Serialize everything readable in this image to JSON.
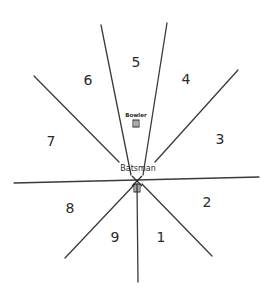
{
  "diagram": {
    "title": "",
    "center": {
      "x": 137,
      "y": 181
    },
    "lines": [
      {
        "name": "upper-left-5-boundary",
        "x1": 101,
        "y1": 25,
        "x2": 131,
        "y2": 175
      },
      {
        "name": "upper-right-5-boundary",
        "x1": 167,
        "y1": 23,
        "x2": 143,
        "y2": 175
      },
      {
        "name": "upper-left-6-7-boundary",
        "x1": 34,
        "y1": 76,
        "x2": 119,
        "y2": 162
      },
      {
        "name": "upper-right-4-3-boundary",
        "x1": 238,
        "y1": 70,
        "x2": 155,
        "y2": 162
      },
      {
        "name": "horizontal-boundary",
        "x1": 14,
        "y1": 183,
        "x2": 259,
        "y2": 177
      },
      {
        "name": "lower-left-8-9-boundary",
        "x1": 65,
        "y1": 258,
        "x2": 135,
        "y2": 184
      },
      {
        "name": "lower-vertical-9-1-boundary",
        "x1": 138,
        "y1": 282,
        "x2": 137,
        "y2": 184
      },
      {
        "name": "lower-right-1-2-boundary",
        "x1": 212,
        "y1": 256,
        "x2": 142,
        "y2": 184
      }
    ],
    "zones": [
      {
        "label": "1",
        "x": 161,
        "y": 242
      },
      {
        "label": "2",
        "x": 207,
        "y": 207
      },
      {
        "label": "3",
        "x": 220,
        "y": 144
      },
      {
        "label": "4",
        "x": 186,
        "y": 84
      },
      {
        "label": "5",
        "x": 136,
        "y": 67
      },
      {
        "label": "6",
        "x": 88,
        "y": 85
      },
      {
        "label": "7",
        "x": 51,
        "y": 146
      },
      {
        "label": "8",
        "x": 70,
        "y": 213
      },
      {
        "label": "9",
        "x": 115,
        "y": 242
      }
    ],
    "bowler": {
      "label": "Bowler",
      "x": 136,
      "y": 117
    },
    "batsman": {
      "label": "Batsman",
      "x": 138,
      "y": 171
    },
    "colors": {
      "ink": "#2a2a2a",
      "background": "#ffffff"
    }
  }
}
